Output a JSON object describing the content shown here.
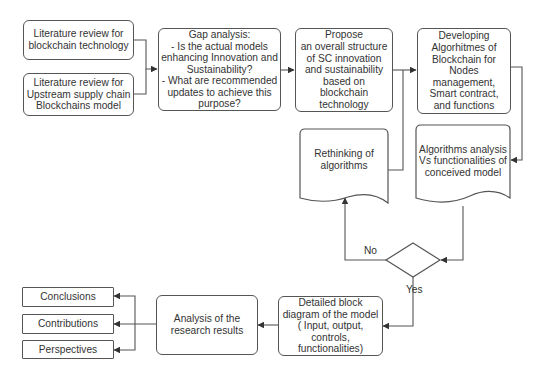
{
  "diagram": {
    "type": "flowchart",
    "nodes": {
      "lit_review_blockchain": {
        "text": "Literature review for\nblockchain technology",
        "shape": "rounded-rect"
      },
      "lit_review_upstream": {
        "text": "Literature review for\nUpstream supply chain\nBlockchains model",
        "shape": "rounded-rect"
      },
      "gap_analysis": {
        "text": "Gap analysis:\n- Is the actual models\nenhancing Innovation and\nSustainability?\n- What are recommended\nupdates to achieve this\npurpose?",
        "shape": "rounded-rect"
      },
      "propose_structure": {
        "text": "Propose\nan overall structure\nof SC innovation\nand sustainability\nbased on\nblockchain\ntechnology",
        "shape": "rounded-rect"
      },
      "developing_algorithms": {
        "text": "Developing\nAlgorhitmes of\nBlockchain for\nNodes\nmanagement,\nSmart contract,\nand functions",
        "shape": "rounded-rect"
      },
      "algorithms_analysis": {
        "text": "Algorithms analysis\nVs functionalities of\nconceived model",
        "shape": "document"
      },
      "rethinking_algorithms": {
        "text": "Rethinking of\nalgorithms",
        "shape": "document"
      },
      "decision": {
        "text": "",
        "shape": "diamond"
      },
      "detailed_block_diagram": {
        "text": "Detailed block\ndiagram of the model\n( Input, output,\ncontrols,\nfunctionalities)",
        "shape": "rounded-rect"
      },
      "analysis_results": {
        "text": "Analysis of the\nresearch results",
        "shape": "rounded-rect"
      },
      "conclusions": {
        "text": "Conclusions",
        "shape": "rect"
      },
      "contributions": {
        "text": "Contributions",
        "shape": "rect"
      },
      "perspectives": {
        "text": "Perspectives",
        "shape": "rect"
      }
    },
    "edge_labels": {
      "no": "No",
      "yes": "Yes"
    },
    "edges": [
      {
        "from": "lit_review_blockchain",
        "to": "gap_analysis"
      },
      {
        "from": "lit_review_upstream",
        "to": "gap_analysis"
      },
      {
        "from": "gap_analysis",
        "to": "propose_structure"
      },
      {
        "from": "propose_structure",
        "to": "developing_algorithms"
      },
      {
        "from": "developing_algorithms",
        "to": "algorithms_analysis"
      },
      {
        "from": "algorithms_analysis",
        "to": "decision"
      },
      {
        "from": "decision",
        "to": "rethinking_algorithms",
        "label": "No"
      },
      {
        "from": "rethinking_algorithms",
        "to": "developing_algorithms"
      },
      {
        "from": "decision",
        "to": "detailed_block_diagram",
        "label": "Yes"
      },
      {
        "from": "detailed_block_diagram",
        "to": "analysis_results"
      },
      {
        "from": "analysis_results",
        "to": "conclusions"
      },
      {
        "from": "analysis_results",
        "to": "contributions"
      },
      {
        "from": "analysis_results",
        "to": "perspectives"
      }
    ],
    "colors": {
      "stroke": "#555555",
      "text": "#333333",
      "fill": "#ffffff"
    }
  }
}
